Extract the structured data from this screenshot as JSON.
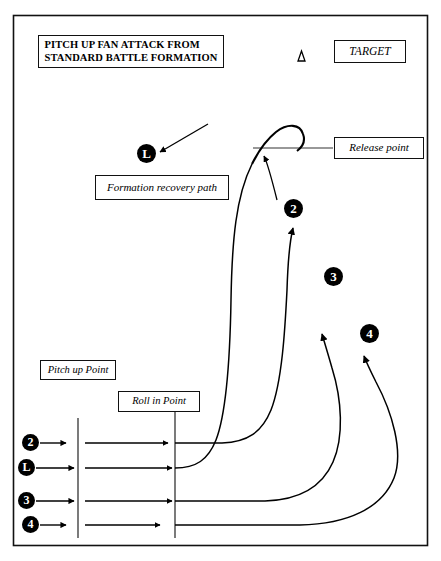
{
  "diagram": {
    "title_line1": "PITCH UP FAN ATTACK FROM",
    "title_line2": "STANDARD BATTLE FORMATION",
    "target_label": "TARGET",
    "target_symbol": "triangle-outline",
    "annotations": {
      "formation_recovery_path": "Formation recovery path",
      "release_point": "Release point",
      "pitch_up_point": "Pitch up Point",
      "roll_in_point": "Roll in Point"
    },
    "markers": {
      "recovery_leader": "L",
      "apex_two": "2",
      "apex_three": "3",
      "apex_four": "4",
      "start_two": "2",
      "start_leader": "L",
      "start_three": "3",
      "start_four": "4"
    },
    "colors": {
      "ink": "#000000",
      "border": "#111111",
      "background": "#ffffff",
      "marker_fill": "#000000",
      "marker_text": "#ffffff"
    }
  }
}
